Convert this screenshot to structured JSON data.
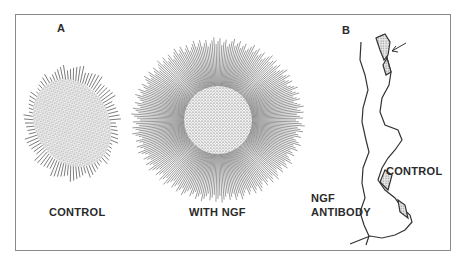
{
  "figure": {
    "panel_a": {
      "letter": "A",
      "left_caption": "CONTROL",
      "right_caption": "WITH NGF"
    },
    "panel_b": {
      "letter": "B",
      "control_label": "CONTROL",
      "antibody_label_line1": "NGF",
      "antibody_label_line2": "ANTIBODY"
    }
  }
}
